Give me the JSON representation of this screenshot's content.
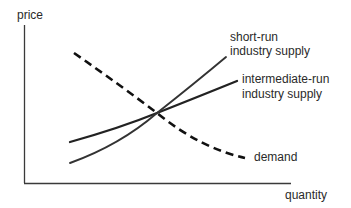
{
  "diagram": {
    "axes": {
      "y_label": "price",
      "x_label": "quantity"
    },
    "curves": [
      {
        "id": "demand",
        "label": "demand",
        "style": "dashed"
      },
      {
        "id": "short-run-supply",
        "label_line1": "short-run",
        "label_line2": "industry supply",
        "style": "solid"
      },
      {
        "id": "intermediate-run-supply",
        "label_line1": "intermediate-run",
        "label_line2": "industry supply",
        "style": "solid"
      }
    ],
    "colors": {
      "axis": "#3a3a3a",
      "curve": "#222222",
      "text": "#2a2a2a"
    }
  }
}
